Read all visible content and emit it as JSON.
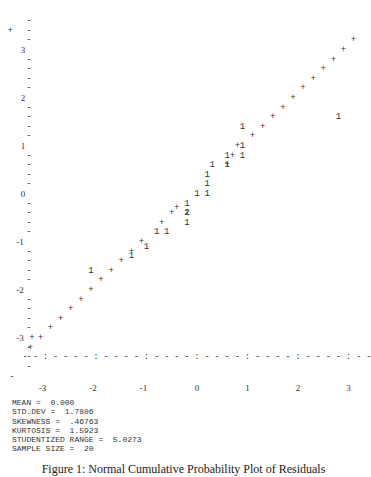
{
  "chart_data": {
    "type": "scatter",
    "title": "Normal Cumulative Probability Plot of Residuals",
    "xlabel": "",
    "ylabel": "",
    "xlim": [
      -3.4,
      3.4
    ],
    "ylim": [
      -3.6,
      3.6
    ],
    "x_ticks": [
      "-3",
      "-2",
      "-1",
      "0",
      "1",
      "2",
      "3"
    ],
    "y_ticks": [
      "3",
      "2",
      "1",
      "0",
      "-1",
      "-2",
      "-3"
    ],
    "grid": false,
    "legend": "none",
    "markers": {
      "reference_line": "+",
      "data_point": "1",
      "coincident_points": "2"
    },
    "reference_line": {
      "description": "normal reference line drawn with '+' characters",
      "points": [
        [
          -3.3,
          -3.2
        ],
        [
          -3.1,
          -3.0
        ],
        [
          -2.9,
          -2.8
        ],
        [
          -2.7,
          -2.6
        ],
        [
          -2.5,
          -2.4
        ],
        [
          -2.3,
          -2.2
        ],
        [
          -2.1,
          -2.0
        ],
        [
          -1.9,
          -1.8
        ],
        [
          -1.7,
          -1.6
        ],
        [
          -1.5,
          -1.4
        ],
        [
          -1.3,
          -1.2
        ],
        [
          -1.1,
          -1.0
        ],
        [
          -0.7,
          -0.6
        ],
        [
          -0.5,
          -0.4
        ],
        [
          -0.4,
          -0.3
        ],
        [
          0.6,
          0.6
        ],
        [
          0.7,
          0.8
        ],
        [
          0.8,
          1.0
        ],
        [
          1.1,
          1.2
        ],
        [
          1.3,
          1.4
        ],
        [
          1.5,
          1.6
        ],
        [
          1.7,
          1.8
        ],
        [
          1.9,
          2.0
        ],
        [
          2.1,
          2.2
        ],
        [
          2.3,
          2.4
        ],
        [
          2.5,
          2.6
        ],
        [
          2.7,
          2.8
        ],
        [
          2.9,
          3.0
        ],
        [
          3.1,
          3.2
        ],
        [
          -3.7,
          3.4
        ]
      ]
    },
    "series": [
      {
        "name": "Residuals",
        "marker": "1",
        "points": [
          [
            -2.1,
            -1.6
          ],
          [
            -1.3,
            -1.3
          ],
          [
            -1.0,
            -1.1
          ],
          [
            -0.8,
            -0.8
          ],
          [
            -0.6,
            -0.8
          ],
          [
            -0.2,
            -0.6
          ],
          [
            -0.2,
            -0.4
          ],
          [
            -0.2,
            -0.2
          ],
          [
            0.0,
            0.0
          ],
          [
            0.2,
            0.0
          ],
          [
            0.2,
            0.2
          ],
          [
            0.2,
            0.4
          ],
          [
            0.3,
            0.6
          ],
          [
            0.6,
            0.6
          ],
          [
            0.6,
            0.8
          ],
          [
            0.9,
            0.8
          ],
          [
            0.9,
            1.0
          ],
          [
            0.9,
            1.4
          ],
          [
            2.8,
            1.6
          ]
        ]
      },
      {
        "name": "Coincident residuals",
        "marker": "2",
        "points": [
          [
            -0.2,
            -0.4
          ]
        ]
      }
    ]
  },
  "axis": {
    "y_labels": [
      {
        "text": "3",
        "v": 3
      },
      {
        "text": "2",
        "v": 2
      },
      {
        "text": "1",
        "v": 1
      },
      {
        "text": "0",
        "v": 0
      },
      {
        "text": "-1",
        "v": -1
      },
      {
        "text": "-2",
        "v": -2
      },
      {
        "text": "-3",
        "v": -3
      }
    ],
    "x_labels": [
      {
        "text": "-3",
        "v": -3
      },
      {
        "text": "-2",
        "v": -2
      },
      {
        "text": "-1",
        "v": -1
      },
      {
        "text": "0",
        "v": 0
      },
      {
        "text": "1",
        "v": 1
      },
      {
        "text": "2",
        "v": 2
      },
      {
        "text": "3",
        "v": 3
      }
    ],
    "x_axis_line": "- - : - - - - : - - - - : - - - - : - - - - : - - - - : - - - - : -"
  },
  "stats": {
    "mean": "MEAN =  0.000",
    "std_dev": "STD.DEV =  1.7806",
    "skewness": "SKEWNESS =  .46763",
    "kurtosis": "KURTOSIS =  1.5923",
    "studentized_range": "STUDENTIZED RANGE =  5.0273",
    "sample_size": "SAMPLE SIZE =  20"
  },
  "caption": "Figure 1: Normal Cumulative Probability Plot of Residuals"
}
